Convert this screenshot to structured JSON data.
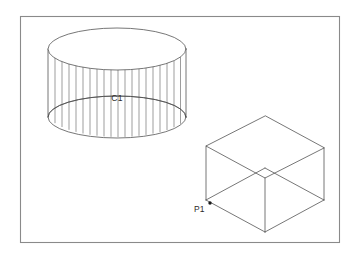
{
  "canvas": {
    "width": 358,
    "height": 258,
    "background_color": "#ffffff"
  },
  "frame": {
    "name": "drawing-border",
    "x": 20,
    "y": 16,
    "width": 320,
    "height": 227,
    "stroke_color": "#8a8a8a"
  },
  "labels": {
    "cylinder_label": "C1",
    "point_label": "P1"
  },
  "objects": {
    "cylinder": {
      "name": "isometric-cylinder",
      "center_x": 117,
      "top_ellipse_cy": 49,
      "bottom_ellipse_cy": 117,
      "radius_x": 69,
      "radius_y": 21,
      "ruling_count": 21,
      "stroke_color": "#4a4a4a",
      "label": "C1",
      "label_x": 117,
      "label_y": 101
    },
    "cube": {
      "name": "isometric-open-box",
      "stroke_color": "#4a4a4a",
      "top_back": [
        265,
        116
      ],
      "top_left": [
        206,
        146
      ],
      "top_right": [
        324,
        148
      ],
      "top_front": [
        265,
        178
      ],
      "bottom_left": [
        206,
        200
      ],
      "bottom_right": [
        324,
        200
      ],
      "bottom_front": [
        265,
        232
      ],
      "label": "P1",
      "label_x": 196,
      "label_y": 210,
      "point_x": 210,
      "point_y": 203
    }
  }
}
